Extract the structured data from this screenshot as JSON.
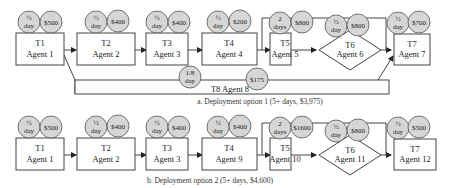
{
  "diagram_a": {
    "caption": "a. Deployment option 1 (5+ days, $3,975)",
    "tasks": [
      {
        "id": "T1",
        "agent": "Agent 1",
        "time": "½ day",
        "time_top": "½",
        "time_bottom": "day",
        "cost": "$500"
      },
      {
        "id": "T2",
        "agent": "Agent 2",
        "time": "½ day",
        "time_top": "½",
        "time_bottom": "day",
        "cost": "$400"
      },
      {
        "id": "T3",
        "agent": "Agent 3",
        "time": "½ day",
        "time_top": "½",
        "time_bottom": "day",
        "cost": "$400"
      },
      {
        "id": "T4",
        "agent": "Agent 4",
        "time": "½ day",
        "time_top": "½",
        "time_bottom": "day",
        "cost": "$200"
      },
      {
        "id": "T5",
        "agent": "Agent 5",
        "time": "2 days",
        "time_top": "2",
        "time_bottom": "days",
        "cost": "$800"
      },
      {
        "id": "T6",
        "agent": "Agent 6",
        "time": "½ day",
        "time_top": "½",
        "time_bottom": "day",
        "cost": "$800"
      },
      {
        "id": "T7",
        "agent": "Agent 7",
        "time": "½ day",
        "time_top": "½",
        "time_bottom": "day",
        "cost": "$700"
      },
      {
        "id": "T8",
        "agent": "Agent 8",
        "label": "T8 Agent 8",
        "time": "1/8 day",
        "time_top": "1/8",
        "time_bottom": "day",
        "cost": "$175"
      }
    ]
  },
  "diagram_b": {
    "caption": "b. Deployment option 2 (5+ days, $4,600)",
    "tasks": [
      {
        "id": "T1",
        "agent": "Agent 1",
        "time_top": "½",
        "time_bottom": "day",
        "cost": "$500"
      },
      {
        "id": "T2",
        "agent": "Agent 2",
        "time_top": "½",
        "time_bottom": "day",
        "cost": "$400"
      },
      {
        "id": "T3",
        "agent": "Agent 3",
        "time_top": "½",
        "time_bottom": "day",
        "cost": "$400"
      },
      {
        "id": "T4",
        "agent": "Agent 9",
        "time_top": "½",
        "time_bottom": "day",
        "cost": "$400"
      },
      {
        "id": "T5",
        "agent": "Agent 10",
        "time_top": "2",
        "time_bottom": "days",
        "cost": "$1600"
      },
      {
        "id": "T6",
        "agent": "Agent 11",
        "time_top": "½",
        "time_bottom": "day",
        "cost": "$800"
      },
      {
        "id": "T7",
        "agent": "Agent 12",
        "time_top": "½",
        "time_bottom": "day",
        "cost": "$500"
      }
    ]
  }
}
